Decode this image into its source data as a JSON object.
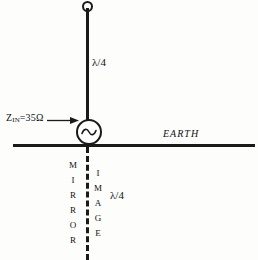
{
  "diagram": {
    "impedance_label": {
      "symbol": "Z",
      "subscript": "IN",
      "value": "=35Ω",
      "full_text": "Zᴵᴺ=35Ω"
    },
    "upper_section_label": "λ/4",
    "lower_section_label": "λ/4",
    "ground_label": "EARTH",
    "mirror_label": "MIRROR",
    "mirror_letters": [
      "M",
      "I",
      "R",
      "R",
      "O",
      "R"
    ],
    "image_label": "IMAGE",
    "image_letters": [
      "I",
      "M",
      "A",
      "G",
      "E"
    ],
    "source_symbol": "sine-wave",
    "colors": {
      "ink": "#1a1a1a",
      "text": "#111111",
      "background": "#fdfdfc"
    }
  }
}
